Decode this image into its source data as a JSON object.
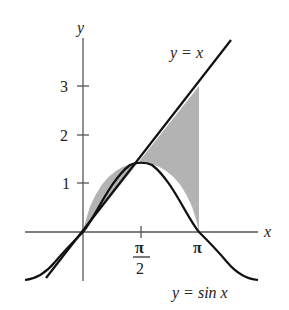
{
  "figure": {
    "axes": {
      "x_label": "x",
      "y_label": "y",
      "x_ticks": [
        {
          "value": 1.5708,
          "label_num": "π",
          "label_den": "2"
        },
        {
          "value": 3.1416,
          "label": "π"
        }
      ],
      "y_ticks": [
        {
          "value": 1,
          "label": "1"
        },
        {
          "value": 2,
          "label": "2"
        },
        {
          "value": 3,
          "label": "3"
        }
      ]
    },
    "curves": [
      {
        "name": "line",
        "equation": "y = x"
      },
      {
        "name": "sine",
        "equation": "y = sin x"
      }
    ],
    "shaded_region": {
      "description": "Region between y = x and y = sin x from x = 0 to x = π",
      "x_from": 0,
      "x_to": 3.1416,
      "fill": "#b0b0b0"
    },
    "colors": {
      "curve": "#111111",
      "axis": "#444444",
      "shade": "#b0b0b0"
    }
  }
}
